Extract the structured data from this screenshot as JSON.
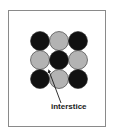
{
  "figure": {
    "label": "interstice",
    "grid": {
      "rows": 3,
      "cols": 3,
      "pattern": [
        [
          "dark",
          "light",
          "dark"
        ],
        [
          "light",
          "dark",
          "light"
        ],
        [
          "dark",
          "light",
          "dark"
        ]
      ]
    },
    "colors": {
      "dark": "#111111",
      "light": "#b3b3b3",
      "outline": "#2a2a2a",
      "frame": "#8a8a8a"
    }
  }
}
